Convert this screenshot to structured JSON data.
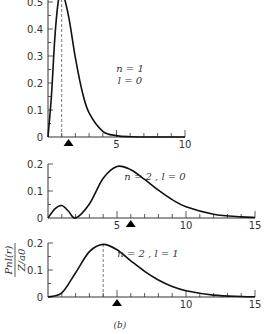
{
  "caption": "(b)",
  "ylabel_num": "P",
  "ylabel_sub": "nl",
  "ylabel_arg": "(r)",
  "ylabel_den": "Z/a",
  "ylabel_den_sub": "0",
  "chart_data": [
    {
      "type": "line",
      "title": "",
      "annotation": [
        "n = 1",
        "l = 0"
      ],
      "xlabel": "",
      "ylabel": "P_nl(r) / (Z/a0)",
      "xlim": [
        0,
        10
      ],
      "ylim": [
        0,
        0.54
      ],
      "xticks": [
        5,
        10
      ],
      "xtick_labels": [
        "5",
        "10"
      ],
      "yticks": [
        0,
        0.1,
        0.2,
        0.3,
        0.4,
        0.5
      ],
      "ytick_labels": [
        "0",
        "0.1",
        "0.2",
        "0.3",
        "0.4",
        "0.5"
      ],
      "dashed_line_x": 1,
      "triangle_marker_x": 1.5,
      "x": [
        0,
        0.25,
        0.5,
        0.75,
        1,
        1.5,
        2,
        2.5,
        3,
        4,
        5,
        6,
        8,
        10
      ],
      "y": [
        0,
        0.152,
        0.368,
        0.502,
        0.541,
        0.448,
        0.293,
        0.168,
        0.089,
        0.021,
        0.005,
        0.001,
        0,
        0
      ]
    },
    {
      "type": "line",
      "annotation": [
        "n = 2 , l = 0"
      ],
      "xlim": [
        0,
        15
      ],
      "ylim": [
        0,
        0.2
      ],
      "xticks": [
        5,
        10,
        15
      ],
      "xtick_labels": [
        "5",
        "10",
        "15"
      ],
      "yticks": [
        0,
        0.1,
        0.2
      ],
      "ytick_labels": [
        "0",
        "0.1",
        "0.2"
      ],
      "triangle_marker_x": 6,
      "x": [
        0,
        0.5,
        1,
        1.5,
        2,
        3,
        4,
        5,
        6,
        7,
        8,
        9,
        10,
        12,
        14,
        15
      ],
      "y": [
        0,
        0.034,
        0.046,
        0.024,
        0,
        0.052,
        0.147,
        0.191,
        0.179,
        0.143,
        0.103,
        0.068,
        0.042,
        0.014,
        0.004,
        0.002
      ]
    },
    {
      "type": "line",
      "annotation": [
        "n = 2 , l = 1"
      ],
      "xlim": [
        0,
        15
      ],
      "ylim": [
        0,
        0.2
      ],
      "xticks": [
        10,
        15
      ],
      "xtick_labels": [
        "10",
        "15"
      ],
      "yticks": [
        0,
        0.1,
        0.2
      ],
      "ytick_labels": [
        "0",
        "0.1",
        "0.2"
      ],
      "dashed_line_x": 4,
      "triangle_marker_x": 5,
      "x": [
        0,
        1,
        2,
        3,
        4,
        5,
        6,
        7,
        8,
        9,
        10,
        12,
        14,
        15
      ],
      "y": [
        0,
        0.015,
        0.09,
        0.168,
        0.195,
        0.175,
        0.134,
        0.095,
        0.063,
        0.039,
        0.023,
        0.007,
        0.002,
        0.001
      ]
    }
  ]
}
